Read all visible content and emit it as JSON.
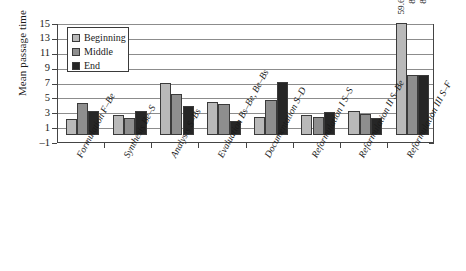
{
  "chart_data": {
    "type": "bar",
    "title": "",
    "xlabel": "",
    "ylabel": "Mean passage time",
    "ylim": [
      -1,
      15
    ],
    "yticks": [
      -1,
      1,
      3,
      5,
      7,
      9,
      11,
      13,
      15
    ],
    "grid": true,
    "legend_position": "upper-left",
    "categories": [
      "Formulation F–Be",
      "Synthesis Be–S",
      "Analysis S–Bs",
      "Evaluation Bs–Be, Be–Bs",
      "Documentation S–D",
      "Reformulation I S–S",
      "Reformulation II S–Be",
      "Reformulation III S–F"
    ],
    "series": [
      {
        "name": "Beginning",
        "color": "#b9b9b9",
        "values": [
          2.1,
          2.6,
          7.0,
          4.4,
          2.4,
          2.6,
          3.2,
          59.6
        ]
      },
      {
        "name": "Middle",
        "color": "#8e8e8e",
        "values": [
          4.2,
          2.3,
          5.5,
          4.1,
          4.7,
          2.4,
          2.8,
          8.0
        ]
      },
      {
        "name": "End",
        "color": "#262626",
        "values": [
          3.2,
          3.2,
          3.9,
          1.8,
          7.1,
          3.1,
          2.2,
          8.0
        ]
      }
    ],
    "value_labels": [
      {
        "group": 7,
        "series": 0,
        "text": "59.6"
      },
      {
        "group": 7,
        "series": 1,
        "text": "8"
      },
      {
        "group": 7,
        "series": 2,
        "text": "8"
      }
    ]
  },
  "axis": {
    "y_tick_labels": [
      "15",
      "13",
      "11",
      "9",
      "7",
      "5",
      "3",
      "1",
      "–1"
    ]
  },
  "legend": {
    "items": [
      {
        "label": "Beginning"
      },
      {
        "label": "Middle"
      },
      {
        "label": "End"
      }
    ]
  }
}
